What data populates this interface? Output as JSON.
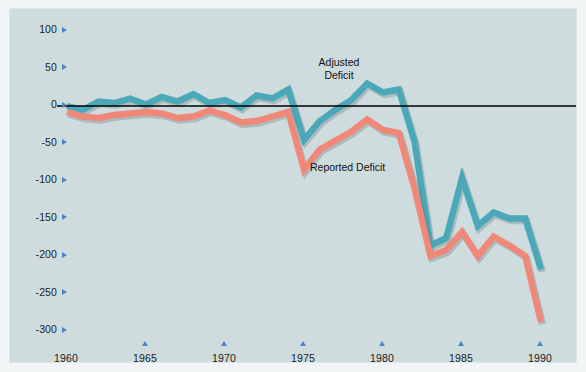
{
  "chart_data": {
    "type": "line",
    "title": "",
    "xlabel": "",
    "ylabel": "Billions of Dollars",
    "xlim": [
      1960,
      1990
    ],
    "ylim": [
      -300,
      100
    ],
    "grid": false,
    "legend_position": "inline-annotations",
    "x_ticks": [
      1960,
      1965,
      1970,
      1975,
      1980,
      1985,
      1990
    ],
    "y_ticks": [
      100,
      50,
      0,
      -50,
      -100,
      -150,
      -200,
      -250,
      -300
    ],
    "zero_line": 0,
    "x": [
      1960,
      1961,
      1962,
      1963,
      1964,
      1965,
      1966,
      1967,
      1968,
      1969,
      1970,
      1971,
      1972,
      1973,
      1974,
      1975,
      1976,
      1977,
      1978,
      1979,
      1980,
      1981,
      1982,
      1983,
      1984,
      1985,
      1986,
      1987,
      1988,
      1989,
      1990
    ],
    "series": [
      {
        "name": "Adjusted Deficit",
        "color": "#4aa8b8",
        "values": [
          0,
          -5,
          6,
          4,
          10,
          2,
          12,
          6,
          16,
          4,
          8,
          -2,
          14,
          10,
          22,
          -45,
          -20,
          -5,
          8,
          30,
          18,
          22,
          -48,
          -186,
          -176,
          -96,
          -160,
          -142,
          -150,
          -150,
          -218
        ]
      },
      {
        "name": "Reported Deficit",
        "color": "#ef8878",
        "values": [
          -8,
          -14,
          -16,
          -12,
          -10,
          -8,
          -10,
          -16,
          -14,
          -6,
          -12,
          -22,
          -20,
          -14,
          -8,
          -85,
          -58,
          -46,
          -34,
          -18,
          -32,
          -36,
          -110,
          -200,
          -192,
          -168,
          -200,
          -174,
          -186,
          -200,
          -288
        ]
      }
    ],
    "annotations": [
      {
        "name": "adjusted-deficit-label",
        "text": "Adjusted\nDeficit"
      },
      {
        "name": "reported-deficit-label",
        "text": "Reported Deficit"
      }
    ]
  },
  "axis": {
    "y_title": "Billions of Dollars",
    "y_tick_labels": [
      "100",
      "50",
      "0",
      "-50",
      "-100",
      "-150",
      "-200",
      "-250",
      "-300"
    ],
    "x_tick_labels": [
      "1960",
      "1965",
      "1970",
      "1975",
      "1980",
      "1985",
      "1990"
    ]
  },
  "annotations": {
    "adjusted": "Adjusted\nDeficit",
    "reported": "Reported Deficit"
  },
  "colors": {
    "adjusted_line": "#4aa8b8",
    "reported_line": "#ef8878",
    "plot_background": "#cfdcdd",
    "page_background": "#f2f5f5",
    "tick_marker": "#4a84c4",
    "zero_line": "#000000"
  }
}
